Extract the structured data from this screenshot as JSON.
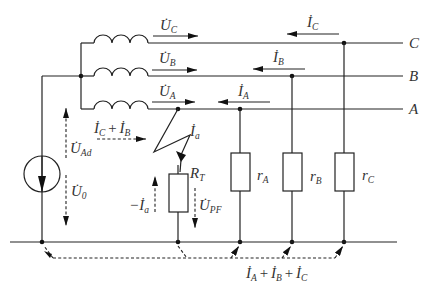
{
  "diagram": {
    "type": "circuit",
    "title": "",
    "phase_lines": [
      {
        "id": "C",
        "label": "C",
        "current": {
          "base": "İ",
          "sub": "C"
        },
        "voltage": {
          "base": "U̇",
          "sub": "C"
        },
        "load": {
          "base": "r",
          "sub": "C"
        }
      },
      {
        "id": "B",
        "label": "B",
        "current": {
          "base": "İ",
          "sub": "B"
        },
        "voltage": {
          "base": "U̇",
          "sub": "B"
        },
        "load": {
          "base": "r",
          "sub": "B"
        }
      },
      {
        "id": "A",
        "label": "A",
        "current": {
          "base": "İ",
          "sub": "A"
        },
        "voltage": {
          "base": "U̇",
          "sub": "A"
        },
        "load": {
          "base": "r",
          "sub": "A"
        }
      }
    ],
    "source": {
      "voltage_ad": {
        "base": "U̇",
        "sub": "Ad"
      },
      "voltage_0": {
        "base": "U̇",
        "sub": "0"
      }
    },
    "fault": {
      "current": {
        "base": "İ",
        "sub": "a"
      },
      "neg_current": {
        "prefix": "−",
        "base": "İ",
        "sub": "a"
      },
      "resistor": {
        "base": "R",
        "sub": "T"
      },
      "voltage": {
        "base": "U̇",
        "sub": "PF"
      }
    },
    "sum_current_cb": {
      "t1": "İ",
      "s1": "C",
      "plus": "+",
      "t2": "İ",
      "s2": "B"
    },
    "sum_current_abc": {
      "t1": "İ",
      "s1": "A",
      "plus1": "+",
      "t2": "İ",
      "s2": "B",
      "plus2": "+",
      "t3": "İ",
      "s3": "C"
    },
    "colors": {
      "stroke": "#222222",
      "text": "#333333",
      "background": "#ffffff"
    }
  }
}
